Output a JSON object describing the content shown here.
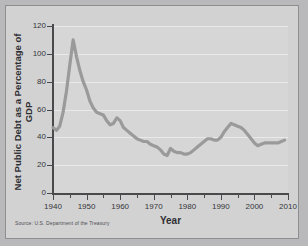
{
  "chart_data": {
    "type": "line",
    "title": "",
    "xlabel": "Year",
    "ylabel": "Net Public Debt as a Percentage of GDP",
    "xlim": [
      1940,
      2010
    ],
    "ylim": [
      0,
      120
    ],
    "grid": true,
    "legend": "none",
    "source_note": "Source: U.S. Department of the Treasury",
    "line_color": "#9a9a9a",
    "y_ticks": [
      0,
      20,
      40,
      60,
      80,
      100,
      120
    ],
    "x_ticks": [
      1940,
      1950,
      1960,
      1970,
      1980,
      1990,
      2000,
      2010
    ],
    "x_minor_ticks": [
      1945,
      1955,
      1965,
      1975,
      1985,
      1995,
      2005
    ],
    "series": [
      {
        "name": "Net Public Debt as a Percentage of GDP",
        "x": [
          1940,
          1941,
          1942,
          1943,
          1944,
          1945,
          1946,
          1947,
          1948,
          1949,
          1950,
          1951,
          1952,
          1953,
          1954,
          1955,
          1956,
          1957,
          1958,
          1959,
          1960,
          1961,
          1962,
          1963,
          1964,
          1965,
          1966,
          1967,
          1968,
          1969,
          1970,
          1971,
          1972,
          1973,
          1974,
          1975,
          1976,
          1977,
          1978,
          1979,
          1980,
          1981,
          1982,
          1983,
          1984,
          1985,
          1986,
          1987,
          1988,
          1989,
          1990,
          1991,
          1992,
          1993,
          1994,
          1995,
          1996,
          1997,
          1998,
          1999,
          2000,
          2001,
          2002,
          2003,
          2004,
          2005,
          2006,
          2007,
          2008,
          2009
        ],
        "values": [
          47,
          45,
          48,
          58,
          73,
          92,
          110,
          98,
          88,
          80,
          74,
          66,
          61,
          58,
          57,
          56,
          52,
          49,
          50,
          54,
          52,
          47,
          45,
          43,
          41,
          39,
          38,
          37,
          37,
          35,
          34,
          33,
          31,
          28,
          27,
          32,
          30,
          29,
          29,
          28,
          28,
          29,
          31,
          33,
          35,
          37,
          39,
          39,
          38,
          38,
          40,
          44,
          47,
          50,
          49,
          48,
          47,
          45,
          42,
          39,
          36,
          34,
          35,
          36,
          36,
          36,
          36,
          36,
          37,
          38
        ]
      }
    ]
  }
}
